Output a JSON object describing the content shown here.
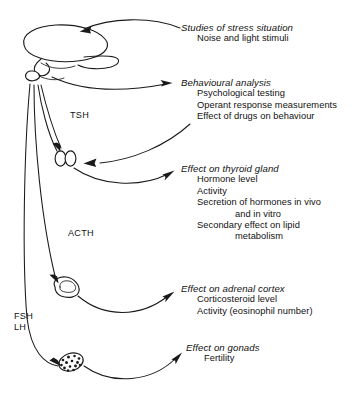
{
  "figure": {
    "background_color": "#ffffff",
    "ink_color": "#1a1a1a"
  },
  "organs": [
    {
      "id": "brain-pituitary",
      "label": "brain-and-pituitary"
    },
    {
      "id": "thyroid",
      "label": "thyroid-gland"
    },
    {
      "id": "adrenal",
      "label": "adrenal-gland"
    },
    {
      "id": "gonad",
      "label": "gonad"
    }
  ],
  "hormone_labels": [
    {
      "id": "tsh",
      "text": "TSH"
    },
    {
      "id": "acth",
      "text": "ACTH"
    },
    {
      "id": "fsh_lh",
      "text": "FSH\nLH"
    }
  ],
  "annotations": [
    {
      "id": "stress",
      "heading": "Studies of stress situation",
      "items": [
        {
          "text": "Noise and light stimuli",
          "indent": 1
        }
      ]
    },
    {
      "id": "behaviour",
      "heading": "Behavioural analysis",
      "items": [
        {
          "text": "Psychological testing",
          "indent": 1
        },
        {
          "text": "Operant response measurements",
          "indent": 1
        },
        {
          "text": "Effect of drugs on behaviour",
          "indent": 1
        }
      ]
    },
    {
      "id": "thyroid",
      "heading": "Effect on thyroid gland",
      "items": [
        {
          "text": "Hormone level",
          "indent": 1
        },
        {
          "text": "Activity",
          "indent": 1
        },
        {
          "text": "Secretion of hormones in vivo",
          "indent": 1
        },
        {
          "text": "and in vitro",
          "indent": 2
        },
        {
          "text": "Secondary effect on lipid",
          "indent": 1
        },
        {
          "text": "metabolism",
          "indent": 2
        }
      ]
    },
    {
      "id": "adrenal",
      "heading": "Effect on adrenal cortex",
      "items": [
        {
          "text": "Corticosteroid level",
          "indent": 1
        },
        {
          "text": "Activity (eosinophil number)",
          "indent": 1
        }
      ]
    },
    {
      "id": "gonads",
      "heading": "Effect on gonads",
      "items": [
        {
          "text": "Fertility",
          "indent": 1
        }
      ]
    }
  ]
}
